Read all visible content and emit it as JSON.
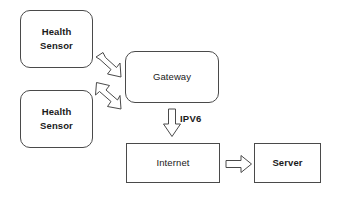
{
  "diagram": {
    "background_color": "#ffffff",
    "stroke_color": "#4a4a4a",
    "text_color": "#1a1a1a",
    "nodes": [
      {
        "id": "sensor-1",
        "label": "Health\nSensor",
        "shape": "rounded-rectangle"
      },
      {
        "id": "sensor-2",
        "label": "Health\nSensor",
        "shape": "rounded-rectangle"
      },
      {
        "id": "gateway",
        "label": "Gateway",
        "shape": "rounded-rectangle"
      },
      {
        "id": "internet",
        "label": "Internet",
        "shape": "rectangle"
      },
      {
        "id": "server",
        "label": "Server",
        "shape": "rectangle"
      }
    ],
    "connectors": [
      {
        "id": "sensor1-to-gateway",
        "direction": "down-right",
        "label": ""
      },
      {
        "id": "sensor2-to-gateway",
        "direction": "up-right",
        "label": ""
      },
      {
        "id": "gateway-to-internet",
        "direction": "down",
        "label": "IPV6"
      },
      {
        "id": "internet-to-server",
        "direction": "right",
        "label": ""
      }
    ]
  }
}
